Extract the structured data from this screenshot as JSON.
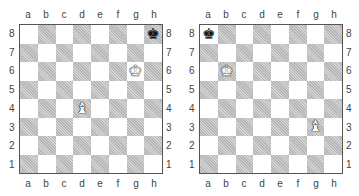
{
  "files": [
    "a",
    "b",
    "c",
    "d",
    "e",
    "f",
    "g",
    "h"
  ],
  "ranks": [
    "8",
    "7",
    "6",
    "5",
    "4",
    "3",
    "2",
    "1"
  ],
  "glyphs": {
    "K": "♚",
    "B": "♝"
  },
  "diagrams": [
    {
      "pieces": [
        {
          "square": "h8",
          "type": "K",
          "color": "black",
          "name": "black-king"
        },
        {
          "square": "g6",
          "type": "K",
          "color": "white",
          "name": "white-king"
        },
        {
          "square": "d4",
          "type": "B",
          "color": "white",
          "name": "white-bishop"
        }
      ]
    },
    {
      "pieces": [
        {
          "square": "a8",
          "type": "K",
          "color": "black",
          "name": "black-king"
        },
        {
          "square": "b6",
          "type": "K",
          "color": "white",
          "name": "white-king"
        },
        {
          "square": "g3",
          "type": "B",
          "color": "white",
          "name": "white-bishop"
        }
      ]
    }
  ]
}
